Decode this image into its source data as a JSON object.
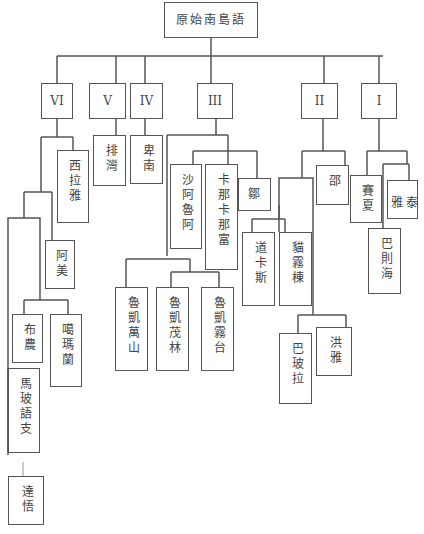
{
  "diagram": {
    "type": "tree",
    "root": "原始南島語",
    "groups": [
      {
        "id": "VI",
        "label": "VI",
        "children": [
          "西拉雅",
          "阿美",
          "布農",
          "噶瑪蘭",
          "馬玻語支",
          "達悟"
        ]
      },
      {
        "id": "V",
        "label": "V",
        "children": [
          "排灣"
        ]
      },
      {
        "id": "IV",
        "label": "IV",
        "children": [
          "卑南"
        ]
      },
      {
        "id": "III",
        "label": "III",
        "children": [
          "沙阿魯阿",
          "卡那卡那富",
          "鄒",
          "魯凱萬山",
          "魯凱茂林",
          "魯凱霧台"
        ]
      },
      {
        "id": "II",
        "label": "II",
        "children": [
          "邵",
          "道卡斯",
          "貓霧棟",
          "巴玻拉",
          "洪雅"
        ]
      },
      {
        "id": "I",
        "label": "I",
        "children": [
          "賽夏",
          "泰雅",
          "巴則海"
        ]
      }
    ]
  },
  "nodes": {
    "root": "原始南島語",
    "VI": "VI",
    "V": "V",
    "IV": "IV",
    "III": "III",
    "II": "II",
    "I": "I",
    "siraya": "西拉雅",
    "amis": "阿美",
    "bunun": "布農",
    "kavalan": "噶瑪蘭",
    "malayo_polynesian": "馬玻語支",
    "tao": "達悟",
    "paiwan": "排灣",
    "puyuma": "卑南",
    "saaroa": "沙阿魯阿",
    "kanakanavu": "卡那卡那富",
    "tsou": "鄒",
    "rukai_wanshan": "魯凱萬山",
    "rukai_maolin": "魯凱茂林",
    "rukai_wutai": "魯凱霧台",
    "thao": "邵",
    "taokas": "道卡斯",
    "babuza": "貓霧棟",
    "papora": "巴玻拉",
    "hoanya": "洪雅",
    "saisiyat": "賽夏",
    "atayal": "泰雅",
    "pazeh": "巴則海"
  }
}
